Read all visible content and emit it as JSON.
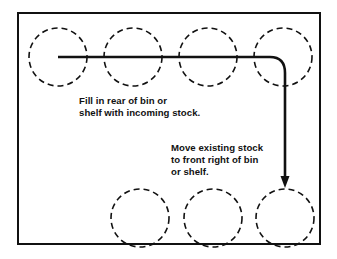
{
  "diagram": {
    "frame": {
      "x": 18,
      "y": 13,
      "width": 302,
      "height": 231,
      "stroke_color": "#111111",
      "stroke_width": 2
    },
    "style": {
      "circle_stroke_color": "#111111",
      "circle_stroke_width": 1.6,
      "circle_dash": "6,4",
      "flow_stroke_color": "#111111",
      "flow_stroke_width": 2.6,
      "background_color": "#ffffff",
      "text_color": "#111111"
    },
    "circle_radius": 29,
    "rows": [
      {
        "name": "rear-row",
        "cy": 57,
        "circles": [
          {
            "label": "rear-bin-1",
            "cx": 58
          },
          {
            "label": "rear-bin-2",
            "cx": 133
          },
          {
            "label": "rear-bin-3",
            "cx": 208
          },
          {
            "label": "rear-bin-4",
            "cx": 283
          }
        ]
      },
      {
        "name": "front-row",
        "cy": 218,
        "circles": [
          {
            "label": "front-bin-1",
            "cx": 140
          },
          {
            "label": "front-bin-2",
            "cx": 213
          },
          {
            "label": "front-bin-3",
            "cx": 285
          }
        ]
      }
    ],
    "flow_arrow": {
      "name": "stock-flow-arrow",
      "path": "M 58 57 L 270 57 Q 285 57 285 73 L 285 180",
      "arrow_tip_y": 188,
      "arrow_tip_x": 285,
      "arrow_half_width": 4.5,
      "arrow_length": 9
    },
    "captions": [
      {
        "name": "fill-rear-caption",
        "lines": [
          "Fill in rear of bin or",
          "shelf with incoming stock."
        ]
      },
      {
        "name": "move-existing-caption",
        "lines": [
          "Move existing stock",
          "to front right of bin",
          "or shelf."
        ]
      }
    ]
  }
}
